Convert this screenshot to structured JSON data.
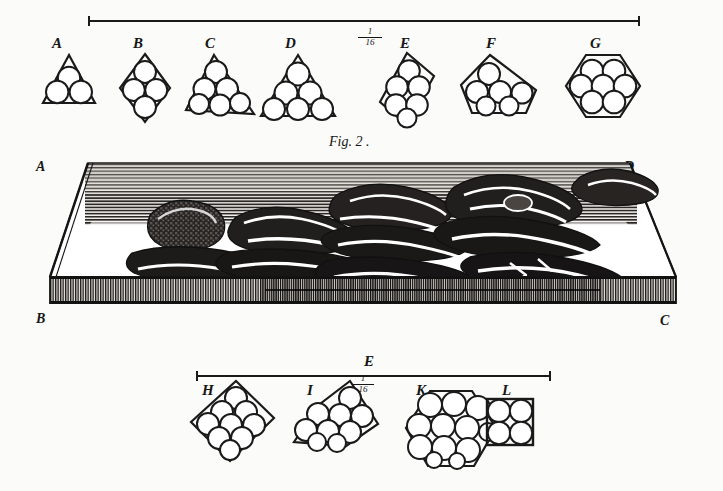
{
  "plate": {
    "title": "Fig. 2",
    "title_caption": "Fig. 2 .",
    "background_color": "#fbfbf9",
    "ink_color": "#1a1a1a",
    "width": 723,
    "height": 491
  },
  "top_scale": {
    "name": "top-scale-bar",
    "fraction_numerator": "1",
    "fraction_denominator": "16",
    "fraction_text": "1/16"
  },
  "bottom_scale": {
    "name": "bottom-scale-bar",
    "label": "E",
    "fraction_numerator": "1",
    "fraction_denominator": "16",
    "fraction_text": "1/16"
  },
  "top_row": {
    "figures": [
      {
        "label": "A",
        "shape": "triangle",
        "circles": 3,
        "rows": "1-2"
      },
      {
        "label": "B",
        "shape": "rhombus",
        "circles": 4,
        "rows": "1-2-1"
      },
      {
        "label": "C",
        "shape": "triangle",
        "circles": 6,
        "rows": "1-2-3"
      },
      {
        "label": "D",
        "shape": "triangle",
        "circles": 6,
        "rows": "1-2-3"
      },
      {
        "label": "E",
        "shape": "rhombus",
        "circles": 6,
        "rows": "1-2-2-1"
      },
      {
        "label": "F",
        "shape": "pentagon",
        "circles": 6,
        "rows": "1-3-2"
      },
      {
        "label": "G",
        "shape": "hexagon",
        "circles": 7,
        "rows": "2-3-2"
      }
    ]
  },
  "bottom_row": {
    "figures": [
      {
        "label": "H",
        "shape": "rhombus",
        "circles": 9,
        "rows": "1-2-3-2-1"
      },
      {
        "label": "I",
        "shape": "rhomboid",
        "circles": 9,
        "rows": "1-3-3-2"
      },
      {
        "label": "K",
        "shape": "hexagon",
        "circles": 12,
        "rows": "3-4-3-2"
      },
      {
        "label": "L",
        "shape": "square",
        "circles": 4,
        "rows": "2-2"
      }
    ]
  },
  "engraving": {
    "name": "fig-2-engraving",
    "description": "shaded perspective engraving of stacked mineral plates on a hatched slab",
    "corners": {
      "top_left": "A",
      "top_right": "D",
      "bottom_left": "B",
      "bottom_right": "C"
    }
  }
}
